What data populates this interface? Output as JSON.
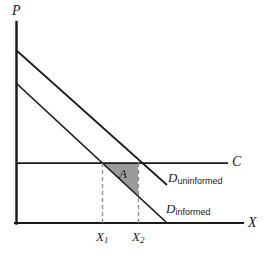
{
  "figure": {
    "kind": "economics-line-diagram",
    "axes": {
      "y_label": "P",
      "x_label": "X",
      "origin_px": [
        16,
        223
      ],
      "y_top_px": 22,
      "x_right_px": 243
    },
    "colors": {
      "line": "#1a1a1a",
      "shade_fill": "#9b9b9b",
      "dash": "#8c8c8c",
      "background": "#ffffff"
    },
    "curves": [
      {
        "name": "uninformed-demand",
        "label": "D",
        "sub": "uninformed",
        "start_px": [
          16,
          50
        ],
        "end_px": [
          167,
          185
        ]
      },
      {
        "name": "informed-demand",
        "label": "D",
        "sub": "informed",
        "start_px": [
          16,
          83
        ],
        "end_px": [
          166,
          222
        ]
      },
      {
        "name": "marginal-cost",
        "label": "C",
        "start_px": [
          16,
          163
        ],
        "end_px": [
          228,
          163
        ]
      }
    ],
    "shaded_region": {
      "label": "A",
      "vertices_px": [
        [
          102,
          163
        ],
        [
          139,
          163
        ],
        [
          139,
          196
        ]
      ]
    },
    "ticks": [
      {
        "label": "X",
        "sub": "1",
        "x_px": 102
      },
      {
        "label": "X",
        "sub": "2",
        "x_px": 139
      }
    ],
    "dashed_guides": [
      {
        "x_px": 102,
        "y_top_px": 163,
        "y_bottom_px": 223
      },
      {
        "x_px": 139,
        "y_top_px": 163,
        "y_bottom_px": 223
      }
    ]
  }
}
